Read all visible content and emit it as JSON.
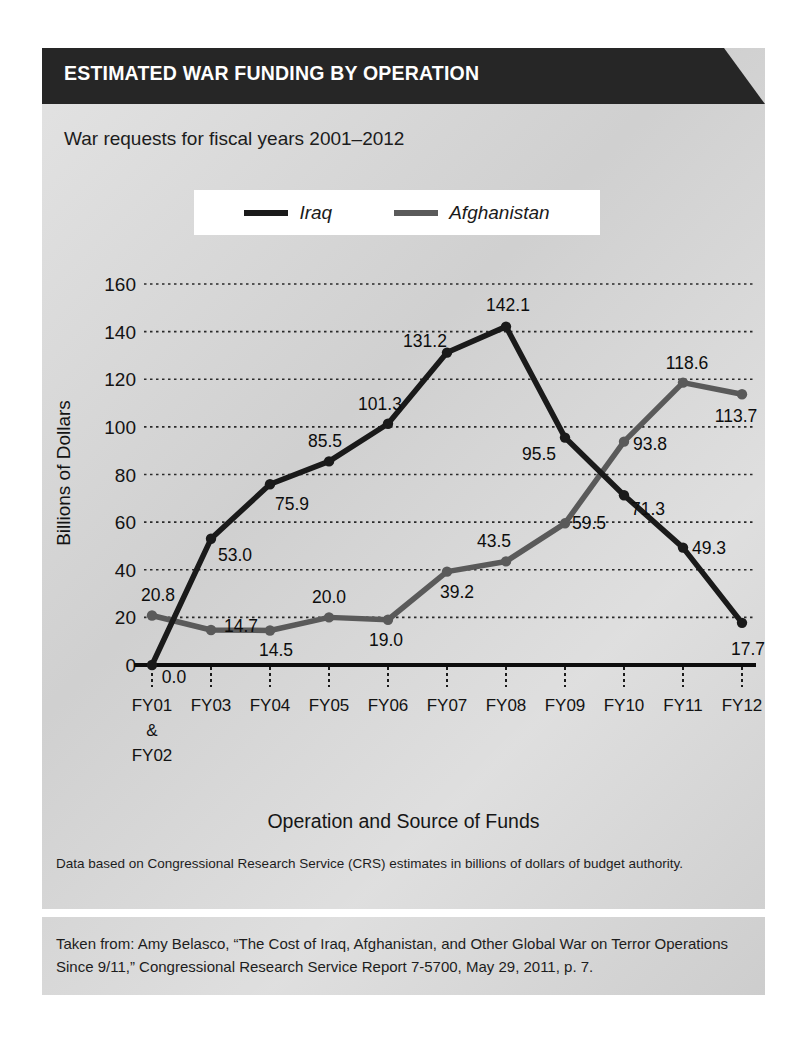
{
  "header": {
    "title": "ESTIMATED WAR FUNDING BY OPERATION",
    "bar_color": "#262626"
  },
  "subtitle": "War requests for fiscal years 2001–2012",
  "legend": {
    "position": "top-center",
    "entries": [
      {
        "label": "Iraq",
        "color": "#1a1a1a"
      },
      {
        "label": "Afghanistan",
        "color": "#5a5a5a"
      }
    ]
  },
  "axis_titles": {
    "x": "Operation and Source of Funds",
    "y": "Billions of Dollars"
  },
  "notes": {
    "data_note": "Data based on Congressional Research Service (CRS) estimates in billions of dollars of budget authority.",
    "source": "Taken from: Amy Belasco, “The Cost of Iraq, Afghanistan, and Other Global War on Terror Operations Since 9/11,” Congressional Research Service Report 7-5700, May 29, 2011, p. 7."
  },
  "chart_data": {
    "type": "line",
    "title": "ESTIMATED WAR FUNDING BY OPERATION",
    "subtitle": "War requests for fiscal years 2001–2012",
    "xlabel": "Operation and Source of Funds",
    "ylabel": "Billions of Dollars",
    "categories": [
      "FY01 & FY02",
      "FY03",
      "FY04",
      "FY05",
      "FY06",
      "FY07",
      "FY08",
      "FY09",
      "FY10",
      "FY11",
      "FY12"
    ],
    "category_lines": [
      [
        "FY01",
        "&",
        "FY02"
      ],
      [
        "FY03"
      ],
      [
        "FY04"
      ],
      [
        "FY05"
      ],
      [
        "FY06"
      ],
      [
        "FY07"
      ],
      [
        "FY08"
      ],
      [
        "FY09"
      ],
      [
        "FY10"
      ],
      [
        "FY11"
      ],
      [
        "FY12"
      ]
    ],
    "series": [
      {
        "name": "Iraq",
        "color": "#1a1a1a",
        "values": [
          0.0,
          53.0,
          75.9,
          85.5,
          101.3,
          131.2,
          142.1,
          95.5,
          71.3,
          49.3,
          17.7
        ],
        "labels": [
          "0.0",
          "53.0",
          "75.9",
          "85.5",
          "101.3",
          "131.2",
          "142.1",
          "95.5",
          "71.3",
          "49.3",
          "17.7"
        ],
        "label_offsets": [
          {
            "dx": 22,
            "dy": 18
          },
          {
            "dx": 24,
            "dy": 22
          },
          {
            "dx": 22,
            "dy": 26
          },
          {
            "dx": -4,
            "dy": -14
          },
          {
            "dx": -8,
            "dy": -14
          },
          {
            "dx": -22,
            "dy": -6
          },
          {
            "dx": 2,
            "dy": -16
          },
          {
            "dx": -26,
            "dy": 22
          },
          {
            "dx": 24,
            "dy": 20
          },
          {
            "dx": 26,
            "dy": 6
          },
          {
            "dx": 6,
            "dy": 32
          }
        ]
      },
      {
        "name": "Afghanistan",
        "color": "#5a5a5a",
        "values": [
          20.8,
          14.7,
          14.5,
          20.0,
          19.0,
          39.2,
          43.5,
          59.5,
          93.8,
          118.6,
          113.7
        ],
        "labels": [
          "20.8",
          "14.7",
          "14.5",
          "20.0",
          "19.0",
          "39.2",
          "43.5",
          "59.5",
          "93.8",
          "118.6",
          "113.7"
        ],
        "label_offsets": [
          {
            "dx": 6,
            "dy": -14
          },
          {
            "dx": 30,
            "dy": 2
          },
          {
            "dx": 6,
            "dy": 26
          },
          {
            "dx": 0,
            "dy": -14
          },
          {
            "dx": -2,
            "dy": 26
          },
          {
            "dx": 10,
            "dy": 26
          },
          {
            "dx": -12,
            "dy": -14
          },
          {
            "dx": 24,
            "dy": 6
          },
          {
            "dx": 26,
            "dy": 8
          },
          {
            "dx": 4,
            "dy": -14
          },
          {
            "dx": -6,
            "dy": 28
          }
        ]
      }
    ],
    "ylim": [
      0,
      160
    ],
    "yticks": [
      0,
      20,
      40,
      60,
      80,
      100,
      120,
      140,
      160
    ],
    "ytick_labels": [
      "0",
      "20",
      "40",
      "60",
      "80",
      "100",
      "120",
      "140",
      "160"
    ],
    "grid": true,
    "grid_style": "dotted-horizontal"
  }
}
